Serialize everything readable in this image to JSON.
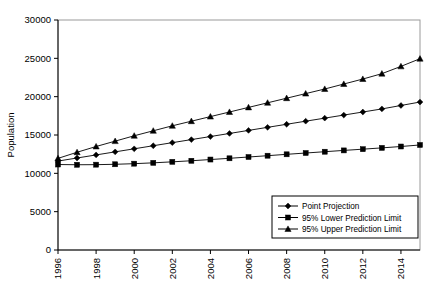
{
  "chart_data": {
    "type": "line",
    "title": "",
    "xlabel": "",
    "ylabel": "Population",
    "xlim": [
      1996,
      2015
    ],
    "ylim": [
      0,
      30000
    ],
    "grid": false,
    "legend_position": "bottom-right",
    "y_ticks": [
      "0",
      "5000",
      "10000",
      "15000",
      "20000",
      "25000",
      "30000"
    ],
    "y_tick_values": [
      0,
      5000,
      10000,
      15000,
      20000,
      25000,
      30000
    ],
    "x_ticks": [
      "1996",
      "1998",
      "2000",
      "2002",
      "2004",
      "2006",
      "2008",
      "2010",
      "2012",
      "2014"
    ],
    "x_tick_values": [
      1996,
      1998,
      2000,
      2002,
      2004,
      2006,
      2008,
      2010,
      2012,
      2014
    ],
    "x": [
      1996,
      1997,
      1998,
      1999,
      2000,
      2001,
      2002,
      2003,
      2004,
      2005,
      2006,
      2007,
      2008,
      2009,
      2010,
      2011,
      2012,
      2013,
      2014,
      2015
    ],
    "series": [
      {
        "name": "Point Projection",
        "marker": "diamond",
        "color": "#000000",
        "values": [
          11600,
          12000,
          12400,
          12800,
          13200,
          13600,
          14000,
          14400,
          14800,
          15200,
          15600,
          16000,
          16400,
          16800,
          17200,
          17600,
          18000,
          18400,
          18850,
          19300
        ]
      },
      {
        "name": "95% Lower Prediction Limit",
        "marker": "square",
        "color": "#000000",
        "values": [
          11150,
          11120,
          11130,
          11180,
          11260,
          11370,
          11500,
          11640,
          11800,
          11960,
          12130,
          12300,
          12480,
          12650,
          12820,
          12990,
          13150,
          13320,
          13500,
          13700
        ]
      },
      {
        "name": "95% Upper Prediction Limit",
        "marker": "triangle",
        "color": "#000000",
        "values": [
          11950,
          12750,
          13500,
          14200,
          14900,
          15550,
          16200,
          16800,
          17400,
          18000,
          18600,
          19200,
          19800,
          20400,
          21000,
          21650,
          22300,
          23000,
          23950,
          24950
        ]
      }
    ]
  }
}
